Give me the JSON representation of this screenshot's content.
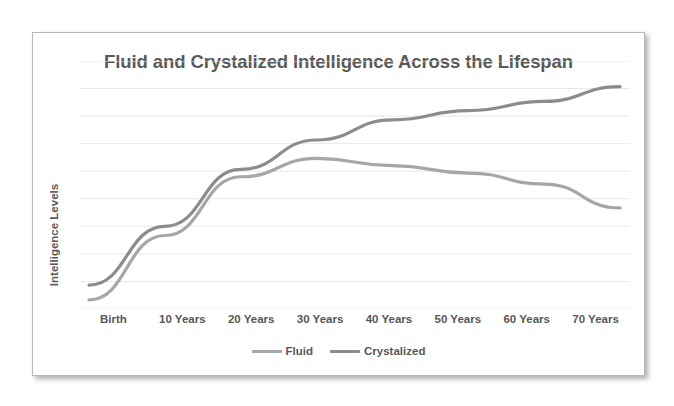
{
  "chart_data": {
    "type": "line",
    "title": "Fluid and Crystalized Intelligence Across the Lifespan",
    "xlabel": "",
    "ylabel": "Intelligence Levels",
    "categories": [
      "Birth",
      "10 Years",
      "20 Years",
      "30 Years",
      "40 Years",
      "50 Years",
      "60 Years",
      "70 Years"
    ],
    "series": [
      {
        "name": "Fluid",
        "color": "#a6a6a6",
        "values": [
          5,
          40,
          72,
          82,
          78,
          74,
          68,
          55
        ]
      },
      {
        "name": "Crystalized",
        "color": "#8c8c8c",
        "values": [
          13,
          45,
          76,
          92,
          103,
          108,
          113,
          121
        ]
      }
    ],
    "ylim": [
      0,
      135
    ],
    "yticks": [
      0,
      15,
      30,
      45,
      60,
      75,
      90,
      105,
      120,
      135
    ],
    "grid": true,
    "y_tick_labels_visible": false,
    "legend_position": "bottom-center"
  },
  "legend": {
    "entries": [
      {
        "label": "Fluid",
        "swatch_color": "#a6a6a6"
      },
      {
        "label": "Crystalized",
        "swatch_color": "#8c8c8c"
      }
    ]
  },
  "style": {
    "grid_color": "#e8e8e8",
    "title_color": "#595959",
    "axis_text_color": "#575757",
    "card_border_color": "#b9b9b9",
    "background": "#ffffff"
  }
}
